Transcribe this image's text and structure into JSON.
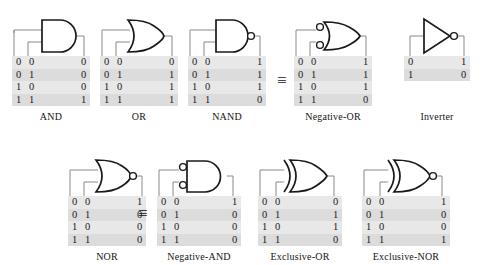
{
  "figure": {
    "equivalence_symbol": "≡",
    "colors": {
      "gate_outline": "#1a1a1a",
      "wire": "#8a8a8a",
      "table_background": "#e8e8e8",
      "table_shade_row": "#dcdcdc",
      "text": "#141414",
      "page_background": "#ffffff"
    }
  },
  "equivalences": [
    {
      "name": "nand-equals-negative-or",
      "symbol": "≡"
    },
    {
      "name": "nor-equals-negative-and",
      "symbol": "≡"
    }
  ],
  "gates": [
    {
      "id": "and",
      "label": "AND",
      "shape": "and-gate-icon",
      "output_bubble": false,
      "input_bubbles": false,
      "inputs": 2,
      "truth_table": {
        "rows": [
          {
            "a": "0",
            "b": "0",
            "y": "0"
          },
          {
            "a": "0",
            "b": "1",
            "y": "0"
          },
          {
            "a": "1",
            "b": "0",
            "y": "0"
          },
          {
            "a": "1",
            "b": "1",
            "y": "1"
          }
        ]
      }
    },
    {
      "id": "or",
      "label": "OR",
      "shape": "or-gate-icon",
      "output_bubble": false,
      "input_bubbles": false,
      "inputs": 2,
      "truth_table": {
        "rows": [
          {
            "a": "0",
            "b": "0",
            "y": "0"
          },
          {
            "a": "0",
            "b": "1",
            "y": "1"
          },
          {
            "a": "1",
            "b": "0",
            "y": "1"
          },
          {
            "a": "1",
            "b": "1",
            "y": "1"
          }
        ]
      }
    },
    {
      "id": "nand",
      "label": "NAND",
      "shape": "nand-gate-icon",
      "output_bubble": true,
      "input_bubbles": false,
      "inputs": 2,
      "truth_table": {
        "rows": [
          {
            "a": "0",
            "b": "0",
            "y": "1"
          },
          {
            "a": "0",
            "b": "1",
            "y": "1"
          },
          {
            "a": "1",
            "b": "0",
            "y": "1"
          },
          {
            "a": "1",
            "b": "1",
            "y": "0"
          }
        ]
      }
    },
    {
      "id": "negative-or",
      "label": "Negative-OR",
      "shape": "negative-or-gate-icon",
      "output_bubble": false,
      "input_bubbles": true,
      "inputs": 2,
      "truth_table": {
        "rows": [
          {
            "a": "0",
            "b": "0",
            "y": "1"
          },
          {
            "a": "0",
            "b": "1",
            "y": "1"
          },
          {
            "a": "1",
            "b": "0",
            "y": "1"
          },
          {
            "a": "1",
            "b": "1",
            "y": "0"
          }
        ]
      }
    },
    {
      "id": "inverter",
      "label": "Inverter",
      "shape": "inverter-gate-icon",
      "output_bubble": true,
      "input_bubbles": false,
      "inputs": 1,
      "truth_table": {
        "rows": [
          {
            "a": "0",
            "y": "1"
          },
          {
            "a": "1",
            "y": "0"
          }
        ]
      }
    },
    {
      "id": "nor",
      "label": "NOR",
      "shape": "nor-gate-icon",
      "output_bubble": true,
      "input_bubbles": false,
      "inputs": 2,
      "truth_table": {
        "rows": [
          {
            "a": "0",
            "b": "0",
            "y": "1"
          },
          {
            "a": "0",
            "b": "1",
            "y": "0"
          },
          {
            "a": "1",
            "b": "0",
            "y": "0"
          },
          {
            "a": "1",
            "b": "1",
            "y": "0"
          }
        ]
      }
    },
    {
      "id": "negative-and",
      "label": "Negative-AND",
      "shape": "negative-and-gate-icon",
      "output_bubble": false,
      "input_bubbles": true,
      "inputs": 2,
      "truth_table": {
        "rows": [
          {
            "a": "0",
            "b": "0",
            "y": "1"
          },
          {
            "a": "0",
            "b": "1",
            "y": "0"
          },
          {
            "a": "1",
            "b": "0",
            "y": "0"
          },
          {
            "a": "1",
            "b": "1",
            "y": "0"
          }
        ]
      }
    },
    {
      "id": "exclusive-or",
      "label": "Exclusive-OR",
      "shape": "xor-gate-icon",
      "output_bubble": false,
      "input_bubbles": false,
      "inputs": 2,
      "truth_table": {
        "rows": [
          {
            "a": "0",
            "b": "0",
            "y": "0"
          },
          {
            "a": "0",
            "b": "1",
            "y": "1"
          },
          {
            "a": "1",
            "b": "0",
            "y": "1"
          },
          {
            "a": "1",
            "b": "1",
            "y": "0"
          }
        ]
      }
    },
    {
      "id": "exclusive-nor",
      "label": "Exclusive-NOR",
      "shape": "xnor-gate-icon",
      "output_bubble": true,
      "input_bubbles": false,
      "inputs": 2,
      "truth_table": {
        "rows": [
          {
            "a": "0",
            "b": "0",
            "y": "1"
          },
          {
            "a": "0",
            "b": "1",
            "y": "0"
          },
          {
            "a": "1",
            "b": "0",
            "y": "0"
          },
          {
            "a": "1",
            "b": "1",
            "y": "1"
          }
        ]
      }
    }
  ]
}
